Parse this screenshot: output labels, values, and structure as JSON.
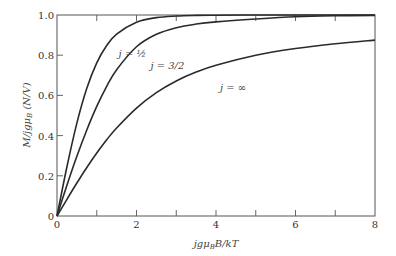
{
  "chart_data": {
    "type": "line",
    "title": "",
    "xlabel": "jgμ_B B/kT",
    "ylabel": "M / jgμ_B (N/V)",
    "xlim": [
      0,
      8
    ],
    "ylim": [
      0,
      1.0
    ],
    "grid": false,
    "legend_position": "inline curve labels",
    "x_ticks": [
      0,
      2,
      4,
      6,
      8
    ],
    "x_tick_labels": [
      "0",
      "2",
      "4",
      "6",
      "8"
    ],
    "x_minor_ticks": [
      1,
      3,
      5,
      7
    ],
    "y_ticks": [
      0,
      0.2,
      0.4,
      0.6,
      0.8,
      1.0
    ],
    "y_tick_labels": [
      "0",
      "0.2",
      "0.4",
      "0.6",
      "0.8",
      "1.0"
    ],
    "x": [
      0,
      0.25,
      0.5,
      0.75,
      1,
      1.25,
      1.5,
      2,
      2.5,
      3,
      3.5,
      4,
      5,
      6,
      7,
      8
    ],
    "series": [
      {
        "name": "j = 1/2",
        "label_text": "j = ½",
        "values": [
          0,
          0.245,
          0.462,
          0.635,
          0.762,
          0.848,
          0.905,
          0.964,
          0.987,
          0.995,
          0.998,
          0.999,
          1.0,
          1.0,
          1.0,
          1.0
        ]
      },
      {
        "name": "j = 3/2",
        "label_text": "j = 3/2",
        "values": [
          0,
          0.153,
          0.297,
          0.428,
          0.545,
          0.645,
          0.728,
          0.842,
          0.904,
          0.937,
          0.955,
          0.966,
          0.98,
          0.991,
          0.996,
          0.998
        ]
      },
      {
        "name": "j = ∞",
        "label_text": "j = ∞",
        "values": [
          0,
          0.083,
          0.164,
          0.241,
          0.313,
          0.379,
          0.438,
          0.537,
          0.614,
          0.672,
          0.716,
          0.75,
          0.8,
          0.833,
          0.857,
          0.875
        ]
      }
    ],
    "annotations": [
      {
        "text": "j = ½",
        "x": 1.55,
        "y": 0.79
      },
      {
        "text": "j = 3/2",
        "x": 2.35,
        "y": 0.73
      },
      {
        "text": "j = ∞",
        "x": 4.1,
        "y": 0.62
      }
    ]
  },
  "labels": {
    "xlabel": "jgμ",
    "xlabel_sub": "B",
    "xlabel_rest": "B/kT",
    "ylabel": "M/jgμ",
    "ylabel_sub": "B",
    "ylabel_rest": " (N/V)"
  }
}
